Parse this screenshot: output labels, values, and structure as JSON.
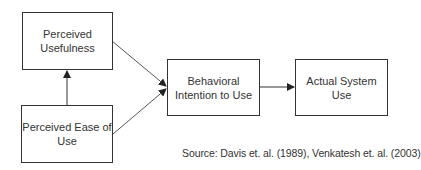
{
  "diagram": {
    "nodes": [
      {
        "id": "perceived-usefulness",
        "label": "Perceived Usefulness",
        "lines": [
          "Perceived",
          "Usefulness"
        ]
      },
      {
        "id": "perceived-ease-of-use",
        "label": "Perceived Ease of Use",
        "lines": [
          "Perceived Ease of",
          "Use"
        ]
      },
      {
        "id": "behavioral-intention",
        "label": "Behavioral Intention to Use",
        "lines": [
          "Behavioral",
          "Intention to Use"
        ]
      },
      {
        "id": "actual-system-use",
        "label": "Actual System Use",
        "lines": [
          "Actual System",
          "Use"
        ]
      }
    ],
    "edges": [
      {
        "from": "perceived-ease-of-use",
        "to": "perceived-usefulness"
      },
      {
        "from": "perceived-usefulness",
        "to": "behavioral-intention"
      },
      {
        "from": "perceived-ease-of-use",
        "to": "behavioral-intention"
      },
      {
        "from": "behavioral-intention",
        "to": "actual-system-use"
      }
    ],
    "source": "Source:  Davis et. al. (1989), Venkatesh et. al. (2003)",
    "colors": {
      "stroke": "#333333",
      "background": "#ffffff"
    }
  }
}
